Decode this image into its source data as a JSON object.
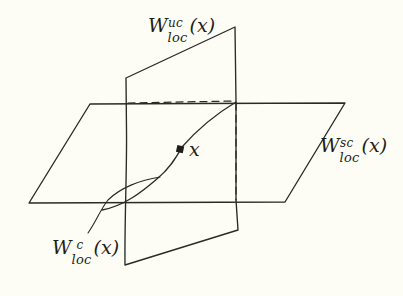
{
  "figure": {
    "background_color": "#fdfdf6",
    "stroke_color": "#2a2a26",
    "labels": {
      "unstable_center": {
        "name": "W-uc-loc",
        "base": "W",
        "superscript": "uc",
        "subscript": "loc",
        "argument": "(x)",
        "full": "W^{uc}_{loc}(x)"
      },
      "stable_center": {
        "name": "W-sc-loc",
        "base": "W",
        "superscript": "sc",
        "subscript": "loc",
        "argument": "(x)",
        "full": "W^{sc}_{loc}(x)"
      },
      "center": {
        "name": "W-c-loc",
        "base": "W",
        "superscript": "c",
        "subscript": "loc",
        "argument": "(x)",
        "full": "W^{c}_{loc}(x)"
      },
      "point": {
        "name": "point-x",
        "text": "x"
      }
    },
    "geometry": {
      "horizontal_plane": {
        "name": "stable-center-manifold-plane",
        "points": "90,104 345,103 285,202 29,203",
        "note": "parallelogram drawn in perspective, label W^{sc}_{loc}(x)"
      },
      "vertical_plane": {
        "name": "unstable-center-manifold-plane",
        "points": "126,78 235,27 238,230 125,265",
        "note": "quadrilateral drawn in perspective, label W^{uc}_{loc}(x)"
      },
      "center_curve": {
        "name": "center-manifold-curve",
        "from": [
          102,
          210
        ],
        "to": [
          236,
          102
        ],
        "note": "intersection curve through marked point x"
      },
      "marked_point": {
        "name": "point-marker",
        "cx": 180,
        "cy": 149,
        "size": 7
      },
      "leader_line": {
        "name": "center-label-leader",
        "from": [
          88,
          232
        ],
        "to": [
          158,
          178
        ]
      },
      "hidden_edges": [
        {
          "name": "hidden-edge-horizontal",
          "from": [
            128,
            103
          ],
          "to": [
            235,
            101
          ]
        },
        {
          "name": "hidden-edge-vertical",
          "from": [
            236,
            102
          ],
          "to": [
            236,
            200
          ]
        }
      ]
    }
  }
}
